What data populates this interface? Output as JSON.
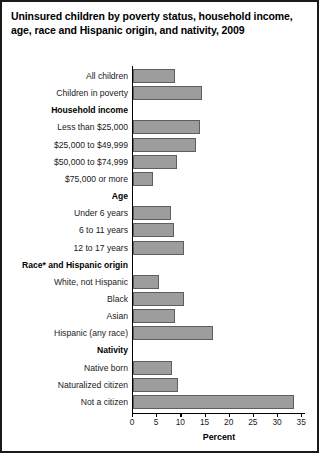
{
  "title": "Uninsured children by poverty status, household income, age, race and Hispanic origin, and nativity, 2009",
  "chart_data": {
    "type": "bar",
    "orientation": "horizontal",
    "title": "Uninsured children by poverty status, household income, age, race and Hispanic origin, and nativity, 2009",
    "xlabel": "Percent",
    "ylabel": "",
    "xlim": [
      0,
      35
    ],
    "xticks": [
      0,
      5,
      10,
      15,
      20,
      25,
      30,
      35
    ],
    "xticklabels": [
      "0",
      "5",
      "10",
      "15",
      "20",
      "25",
      "30",
      "35"
    ],
    "grid": false,
    "legend": null,
    "categories": [
      "All children",
      "Children in poverty",
      "Household income",
      "Less than $25,000",
      "$25,000 to $49,999",
      "$50,000 to $74,999",
      "$75,000 or more",
      "Age",
      "Under 6 years",
      "6 to 11 years",
      "12 to 17 years",
      "Race* and Hispanic origin",
      "White, not Hispanic",
      "Black",
      "Asian",
      "Hispanic (any race)",
      "Nativity",
      "Native born",
      "Naturalized citizen",
      "Not a citizen"
    ],
    "values": [
      8.6,
      14.3,
      null,
      13.9,
      13.0,
      9.1,
      4.1,
      null,
      7.8,
      8.5,
      10.5,
      null,
      5.4,
      10.5,
      8.7,
      16.6,
      null,
      8.1,
      9.3,
      33.3
    ],
    "bar_color": "#9d9d9d",
    "bar_edge_color": "#5e5e5e"
  },
  "rows": [
    {
      "label": "All children",
      "value": 8.6,
      "header": false
    },
    {
      "label": "Children in poverty",
      "value": 14.3,
      "header": false
    },
    {
      "label": "Household income",
      "value": null,
      "header": true
    },
    {
      "label": "Less than $25,000",
      "value": 13.9,
      "header": false
    },
    {
      "label": "$25,000 to $49,999",
      "value": 13.0,
      "header": false
    },
    {
      "label": "$50,000 to $74,999",
      "value": 9.1,
      "header": false
    },
    {
      "label": "$75,000 or more",
      "value": 4.1,
      "header": false
    },
    {
      "label": "Age",
      "value": null,
      "header": true
    },
    {
      "label": "Under 6 years",
      "value": 7.8,
      "header": false
    },
    {
      "label": "6 to 11 years",
      "value": 8.5,
      "header": false
    },
    {
      "label": "12 to 17 years",
      "value": 10.5,
      "header": false
    },
    {
      "label": "Race* and Hispanic origin",
      "value": null,
      "header": true
    },
    {
      "label": "White, not Hispanic",
      "value": 5.4,
      "header": false
    },
    {
      "label": "Black",
      "value": 10.5,
      "header": false
    },
    {
      "label": "Asian",
      "value": 8.7,
      "header": false
    },
    {
      "label": "Hispanic (any race)",
      "value": 16.6,
      "header": false
    },
    {
      "label": "Nativity",
      "value": null,
      "header": true
    },
    {
      "label": "Native born",
      "value": 8.1,
      "header": false
    },
    {
      "label": "Naturalized citizen",
      "value": 9.3,
      "header": false
    },
    {
      "label": "Not a citizen",
      "value": 33.3,
      "header": false
    }
  ],
  "axis": {
    "xlabel": "Percent",
    "ticks": [
      "0",
      "5",
      "10",
      "15",
      "20",
      "25",
      "30",
      "35"
    ]
  }
}
